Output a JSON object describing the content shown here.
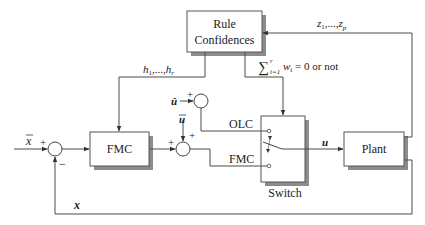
{
  "blocks": {
    "rule_confidences": {
      "line1": "Rule",
      "line2": "Confidences"
    },
    "fmc": {
      "label": "FMC"
    },
    "plant": {
      "label": "Plant"
    },
    "switch": {
      "label": "Switch",
      "port_top": "OLC",
      "port_bottom": "FMC"
    }
  },
  "signals": {
    "x_bar": "x",
    "x": "x",
    "u_hat": "û",
    "u_bar": "u",
    "u": "u",
    "h": "h",
    "h_sub1": "1",
    "h_mid": ",...,",
    "h_subr": "r",
    "z": "z",
    "z_sub1": "1",
    "z_mid": ",...,",
    "z_subp": "p",
    "sum_condition_sigma": "∑",
    "sum_condition_sup": "r",
    "sum_condition_sub": "i=1",
    "sum_condition_w": "w",
    "sum_condition_wsub": "i",
    "sum_condition_rest": " = 0 or not"
  },
  "signs": {
    "j1_plus": "+",
    "j1_minus": "−",
    "j2_plus_left": "+",
    "j2_plus_top": "+",
    "j3_plus": "+"
  },
  "colors": {
    "line": "#4a4a4a",
    "box_fill": "#ffffff",
    "shadow": "#8c8c8c",
    "text": "#222222"
  }
}
